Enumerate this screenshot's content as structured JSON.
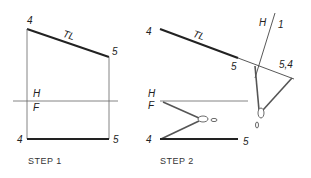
{
  "diagram": {
    "colors": {
      "line": "#222222",
      "thin": "#555555",
      "background": "#ffffff"
    },
    "step1": {
      "title": "STEP 1",
      "labels": {
        "top4": "4",
        "tl": "TL",
        "top5": "5",
        "h": "H",
        "f": "F",
        "bottom4": "4",
        "bottom5": "5"
      }
    },
    "step2": {
      "title": "STEP 2",
      "labels": {
        "top4": "4",
        "tl": "TL",
        "top5": "5",
        "fold_h": "H",
        "fold_1": "1",
        "point54": "5,4",
        "h": "H",
        "f": "F",
        "bottom4": "4",
        "bottom5": "5"
      }
    }
  }
}
